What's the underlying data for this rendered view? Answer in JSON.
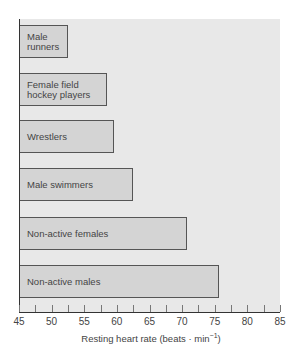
{
  "chart_data": {
    "type": "bar",
    "orientation": "horizontal",
    "title": "",
    "xlabel": "Resting heart rate (beats · min⁻¹)",
    "xlabel_main": "Resting heart rate (beats · min",
    "xlabel_sup": "−1",
    "xlabel_end": ")",
    "ylabel": "",
    "xlim": [
      45,
      85
    ],
    "xticks": [
      45,
      50,
      55,
      60,
      65,
      70,
      75,
      80,
      85
    ],
    "minor_tick_step": 2.5,
    "grid": false,
    "legend": null,
    "categories": [
      "Male\nrunners",
      "Female field\nhockey players",
      "Wrestlers",
      "Male swimmers",
      "Non-active females",
      "Non-active males"
    ],
    "values": [
      52.5,
      58.5,
      59.5,
      62.5,
      70.7,
      75.7
    ],
    "colors": {
      "plot_background": "#e8e8e8",
      "bar_fill": "#d4d4d4",
      "bar_border": "#555555",
      "axis": "#333333"
    }
  }
}
